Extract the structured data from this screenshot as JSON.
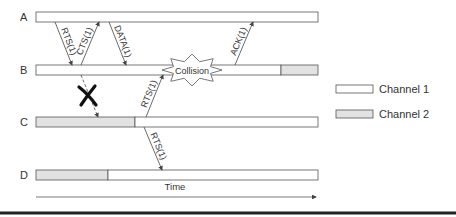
{
  "diagram": {
    "colors": {
      "channel1": "#ffffff",
      "channel2": "#e2e2e2",
      "stroke": "#555555",
      "text": "#333333",
      "rule": "#222222"
    },
    "timeline": {
      "x_start": 36,
      "x_end": 318,
      "bar_height": 10
    },
    "rows": [
      {
        "label": "A",
        "y": 12,
        "segments": [
          {
            "from": 36,
            "to": 318,
            "channel": 1
          }
        ]
      },
      {
        "label": "B",
        "y": 65,
        "segments": [
          {
            "from": 36,
            "to": 281,
            "channel": 1
          },
          {
            "from": 281,
            "to": 318,
            "channel": 2
          }
        ]
      },
      {
        "label": "C",
        "y": 117,
        "segments": [
          {
            "from": 36,
            "to": 135,
            "channel": 2
          },
          {
            "from": 135,
            "to": 318,
            "channel": 1
          }
        ]
      },
      {
        "label": "D",
        "y": 170,
        "segments": [
          {
            "from": 36,
            "to": 108,
            "channel": 2
          },
          {
            "from": 108,
            "to": 318,
            "channel": 1
          }
        ]
      }
    ],
    "messages": [
      {
        "label": "RTS(1)",
        "x1": 55,
        "y1": 22,
        "x2": 72,
        "y2": 65,
        "dashed": false
      },
      {
        "label": "CTS(1)",
        "x1": 81,
        "y1": 65,
        "x2": 99,
        "y2": 22,
        "dashed": false
      },
      {
        "label": "DATA(1)",
        "x1": 109,
        "y1": 22,
        "x2": 126,
        "y2": 65,
        "dashed": false
      },
      {
        "label": "ACK(1)",
        "x1": 235,
        "y1": 65,
        "x2": 253,
        "y2": 22,
        "dashed": false
      },
      {
        "label": "RTS(1)",
        "x1": 146,
        "y1": 117,
        "x2": 163,
        "y2": 75,
        "dashed": false
      },
      {
        "label": "RTS(1)",
        "x1": 144,
        "y1": 127,
        "x2": 162,
        "y2": 170,
        "dashed": false
      },
      {
        "label": "",
        "x1": 81,
        "y1": 75,
        "x2": 98,
        "y2": 117,
        "dashed": true
      }
    ],
    "collision": {
      "label": "Collision",
      "cx": 192,
      "cy": 70
    },
    "blocked_mark": {
      "symbol": "X",
      "cx": 88,
      "cy": 96
    },
    "time_axis": {
      "label": "Time",
      "y": 197
    },
    "legend": [
      {
        "label": "Channel 1",
        "channel": 1,
        "y": 85
      },
      {
        "label": "Channel 2",
        "channel": 2,
        "y": 110
      }
    ]
  }
}
